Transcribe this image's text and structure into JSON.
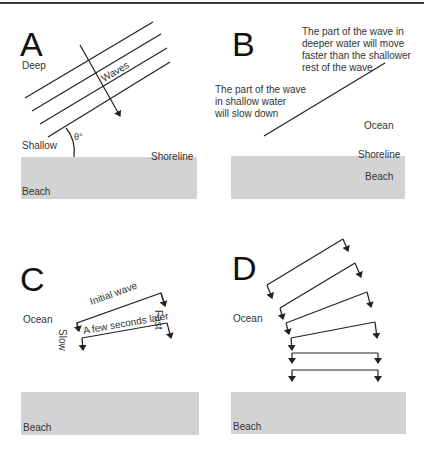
{
  "panels": {
    "a": {
      "letter": "A",
      "labels": {
        "deep": "Deep",
        "shallow": "Shallow",
        "shoreline": "Shoreline",
        "beach": "Beach",
        "waves": "Waves",
        "angle": "θ°"
      }
    },
    "b": {
      "letter": "B",
      "notes": {
        "deep": [
          "The part of the wave in",
          "deeper water will move",
          "faster than the shallower",
          "rest of the wave"
        ],
        "shallow": [
          "The part of the wave",
          "in shallow water",
          "will slow down"
        ]
      },
      "labels": {
        "ocean": "Ocean",
        "shoreline": "Shoreline",
        "beach": "Beach"
      }
    },
    "c": {
      "letter": "C",
      "labels": {
        "ocean": "Ocean",
        "beach": "Beach",
        "initial": "Initial wave",
        "later": "A few seconds later",
        "fast": "Fast",
        "slow": "Slow"
      }
    },
    "d": {
      "letter": "D",
      "labels": {
        "ocean": "Ocean",
        "beach": "Beach"
      }
    }
  },
  "colors": {
    "beach": "#d3d3d3",
    "line": "#222222",
    "text": "#333333"
  }
}
